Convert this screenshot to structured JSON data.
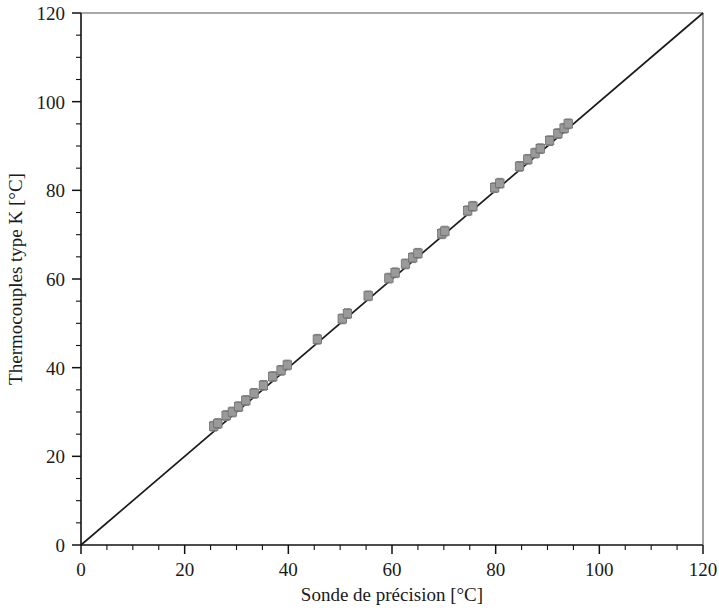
{
  "chart_data": {
    "type": "scatter",
    "title": "",
    "xlabel": "Sonde de précision [°C]",
    "ylabel": "Thermocouples type K [°C]",
    "xlim": [
      0,
      120
    ],
    "ylim": [
      0,
      120
    ],
    "xticks": [
      0,
      20,
      40,
      60,
      80,
      100,
      120
    ],
    "yticks": [
      0,
      20,
      40,
      60,
      80,
      100,
      120
    ],
    "xtick_labels": [
      "0",
      "20",
      "40",
      "60",
      "80",
      "100",
      "120"
    ],
    "ytick_labels": [
      "0",
      "20",
      "40",
      "60",
      "80",
      "100",
      "120"
    ],
    "minor_tick_step": 5,
    "grid": false,
    "legend": "none",
    "x_unit": "°C",
    "y_unit": "°C",
    "reference_line": {
      "name": "identity-line",
      "equation": "y = x",
      "from": [
        0,
        120
      ],
      "to": [
        120,
        120
      ],
      "x_start": 0,
      "y_start": 0,
      "x_end": 120,
      "y_end": 120,
      "color": "#1b1b1b"
    },
    "marker": {
      "shape": "square",
      "color": "#9a9a9a",
      "edge_color": "#6e6e6e",
      "error_bars": "vertical"
    },
    "series": [
      {
        "name": "Thermocouples type K vs sonde de précision",
        "color": "#9a9a9a",
        "x": [
          25.6,
          26.4,
          28.0,
          29.2,
          30.4,
          31.8,
          33.4,
          35.2,
          37.0,
          38.6,
          39.8,
          45.6,
          50.4,
          51.4,
          55.4,
          59.4,
          60.6,
          62.6,
          64.0,
          65.0,
          69.6,
          70.2,
          74.6,
          75.6,
          79.8,
          80.8,
          84.6,
          86.2,
          87.6,
          88.6,
          90.4,
          92.0,
          93.2,
          94.0
        ],
        "y": [
          26.8,
          27.4,
          29.2,
          30.0,
          31.2,
          32.6,
          34.2,
          36.0,
          38.0,
          39.4,
          40.6,
          46.4,
          51.0,
          52.2,
          56.2,
          60.2,
          61.4,
          63.4,
          64.8,
          65.8,
          70.2,
          70.8,
          75.4,
          76.4,
          80.6,
          81.6,
          85.4,
          87.0,
          88.4,
          89.4,
          91.2,
          92.8,
          94.0,
          95.0
        ],
        "yerr": [
          1.1,
          1.1,
          1.1,
          1.1,
          1.1,
          1.1,
          1.1,
          1.1,
          1.1,
          1.1,
          1.1,
          1.1,
          1.1,
          1.1,
          1.1,
          1.1,
          1.1,
          1.1,
          1.1,
          1.1,
          1.1,
          1.1,
          1.1,
          1.1,
          1.1,
          1.1,
          1.1,
          1.1,
          1.1,
          1.1,
          1.1,
          1.1,
          1.1,
          1.1
        ]
      }
    ]
  }
}
